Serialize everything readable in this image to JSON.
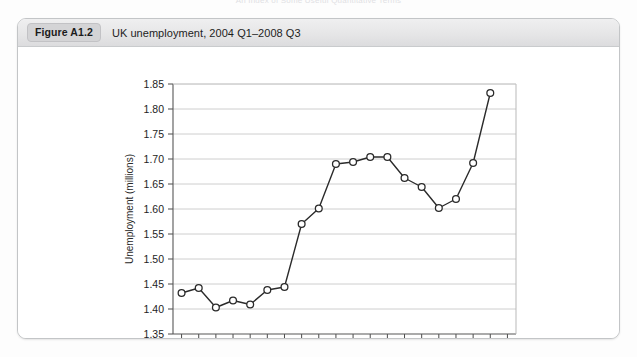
{
  "page": {
    "running_head": "An Index of Some Useful Quantitative Terms"
  },
  "figure": {
    "badge": "Figure A1.2",
    "caption": "UK unemployment, 2004 Q1–2008 Q3"
  },
  "chart_data": {
    "type": "line",
    "title": "UK unemployment, 2004 Q1–2008 Q3",
    "xlabel": "",
    "ylabel": "Unemployment (millions)",
    "ylim": [
      1.35,
      1.85
    ],
    "ytick_step": 0.05,
    "ytick_labels": [
      "1.35",
      "1.40",
      "1.45",
      "1.50",
      "1.55",
      "1.60",
      "1.65",
      "1.70",
      "1.75",
      "1.80",
      "1.85"
    ],
    "ytick_values": [
      1.35,
      1.4,
      1.45,
      1.5,
      1.55,
      1.6,
      1.65,
      1.7,
      1.75,
      1.8,
      1.85
    ],
    "xtick_labels": [
      "2004",
      "2005",
      "2006",
      "2007",
      "2008"
    ],
    "xtick_values": [
      2004,
      2005,
      2006,
      2007,
      2008
    ],
    "xlim": [
      2003.875,
      2008.875
    ],
    "grid": "horizontal",
    "legend": null,
    "marker": "open-circle",
    "line_color": "#2b2b2b",
    "marker_fill": "#ffffff",
    "grid_color": "#c8c8c8",
    "x": [
      "2004 Q1",
      "2004 Q2",
      "2004 Q3",
      "2004 Q4",
      "2005 Q1",
      "2005 Q2",
      "2005 Q3",
      "2005 Q4",
      "2006 Q1",
      "2006 Q2",
      "2006 Q3",
      "2006 Q4",
      "2007 Q1",
      "2007 Q2",
      "2007 Q3",
      "2007 Q4",
      "2008 Q1",
      "2008 Q2",
      "2008 Q3"
    ],
    "values": [
      1.432,
      1.442,
      1.403,
      1.417,
      1.409,
      1.438,
      1.444,
      1.57,
      1.601,
      1.69,
      1.694,
      1.704,
      1.704,
      1.662,
      1.644,
      1.602,
      1.62,
      1.692,
      1.832
    ]
  }
}
